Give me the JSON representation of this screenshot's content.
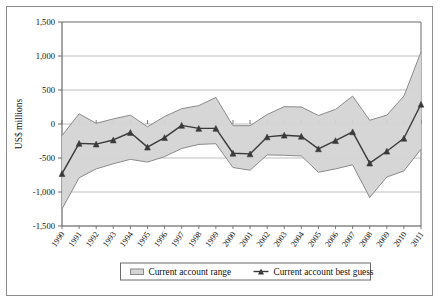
{
  "chart_data": {
    "type": "area",
    "title": "",
    "xlabel": "",
    "ylabel": "US$ millions",
    "ylim": [
      -1500,
      1500
    ],
    "yticks": [
      "-1,500",
      "-1,000",
      "-500",
      "0",
      "500",
      "1,000",
      "1,500"
    ],
    "ytick_values": [
      -1500,
      -1000,
      -500,
      0,
      500,
      1000,
      1500
    ],
    "grid": true,
    "legend_position": "bottom",
    "categories": [
      "1990",
      "1991",
      "1992",
      "1993",
      "1994",
      "1995",
      "1996",
      "1997",
      "1998",
      "1999",
      "2000",
      "2001",
      "2002",
      "2003",
      "2004",
      "2005",
      "2006",
      "2007",
      "2008",
      "2009",
      "2010",
      "2011"
    ],
    "series": [
      {
        "name": "Current account range",
        "type": "band",
        "upper": [
          -170,
          150,
          10,
          75,
          130,
          -40,
          110,
          225,
          270,
          390,
          -25,
          -25,
          140,
          255,
          250,
          125,
          215,
          410,
          55,
          130,
          410,
          1060
        ],
        "lower": [
          -1250,
          -790,
          -660,
          -585,
          -520,
          -560,
          -480,
          -360,
          -300,
          -290,
          -640,
          -680,
          -455,
          -460,
          -470,
          -710,
          -660,
          -600,
          -1080,
          -780,
          -690,
          -370
        ]
      },
      {
        "name": "Current account best guess",
        "type": "line",
        "marker": "triangle",
        "values": [
          -730,
          -285,
          -295,
          -235,
          -125,
          -340,
          -200,
          -20,
          -65,
          -65,
          -430,
          -440,
          -190,
          -165,
          -180,
          -365,
          -245,
          -115,
          -575,
          -400,
          -210,
          290
        ]
      }
    ]
  },
  "legend": {
    "items": [
      {
        "label": "Current account range",
        "marker": "band-swatch"
      },
      {
        "label": "Current account best guess",
        "marker": "line-triangle"
      }
    ]
  },
  "colors": {
    "band_fill": "#d4d4d4",
    "band_stroke": "#8a8a8a",
    "line": "#3a3a3a",
    "grid": "#b5b5b5",
    "axis": "#6b6b6b",
    "frame": "#8c8c8c"
  }
}
